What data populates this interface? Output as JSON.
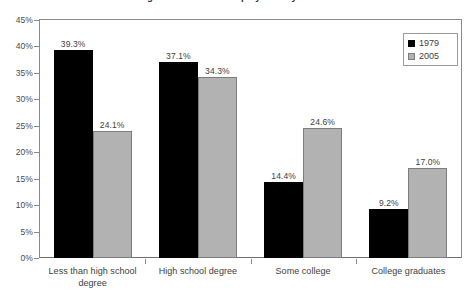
{
  "chart_data": {
    "type": "bar",
    "title": "Percentage distribution of employment by education level",
    "xlabel": "",
    "ylabel": "",
    "ylim": [
      0,
      45
    ],
    "ytick_step": 5,
    "grid": false,
    "legend_position": "top-right",
    "categories": [
      "Less than high school degree",
      "High school degree",
      "Some college",
      "College graduates"
    ],
    "ytick_labels": [
      "45%",
      "40%",
      "35%",
      "30%",
      "25%",
      "20%",
      "15%",
      "10%",
      "5%",
      "0%"
    ],
    "series": [
      {
        "name": "1979",
        "color": "#000000",
        "values": [
          39.3,
          37.1,
          14.4,
          9.2
        ],
        "labels": [
          "39.3%",
          "37.1%",
          "14.4%",
          "9.2%"
        ]
      },
      {
        "name": "2005",
        "color": "#b2b2b2",
        "values": [
          24.1,
          34.3,
          24.6,
          17.0
        ],
        "labels": [
          "24.1%",
          "34.3%",
          "24.6%",
          "17.0%"
        ]
      }
    ]
  }
}
